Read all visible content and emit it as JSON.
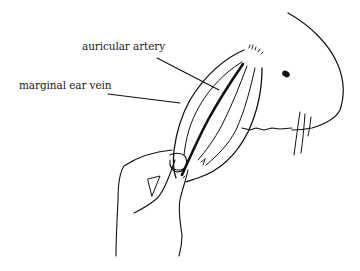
{
  "figure": {
    "line_color": "#111111",
    "background": "#ffffff"
  },
  "labels": [
    {
      "id": "auricular-artery",
      "text": "auricular artery"
    },
    {
      "id": "marginal-ear-vein",
      "text": "marginal ear vein"
    }
  ]
}
